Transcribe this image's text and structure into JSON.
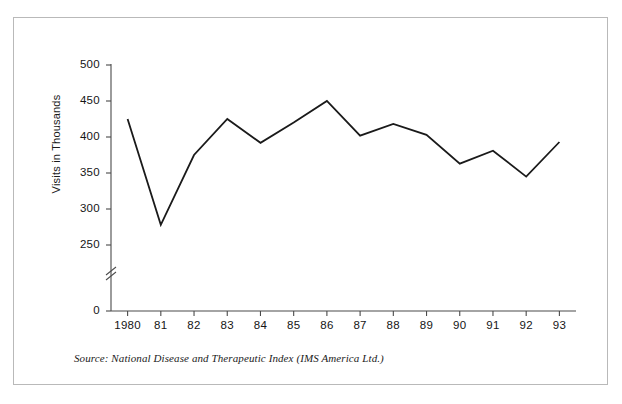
{
  "figure": {
    "frame_color": "#b9b9b9",
    "background": "#ffffff",
    "line_color": "#1a1a1a",
    "axis_color": "#4a4a4a"
  },
  "source_note": "Source: National Disease and Therapeutic Index (IMS America Ltd.)",
  "axis_break_symbol": "axis-break-double-slash",
  "chart_data": {
    "type": "line",
    "title": "",
    "subtitle": "",
    "xlabel": "",
    "ylabel": "Visits in Thousands",
    "categories": [
      "1980",
      "81",
      "82",
      "83",
      "84",
      "85",
      "86",
      "87",
      "88",
      "89",
      "90",
      "91",
      "92",
      "93"
    ],
    "values": [
      425,
      278,
      375,
      425,
      392,
      420,
      450,
      402,
      418,
      403,
      363,
      381,
      345,
      393
    ],
    "series": [
      {
        "name": "Visits in Thousands",
        "values": [
          425,
          278,
          375,
          425,
          392,
          420,
          450,
          402,
          418,
          403,
          363,
          381,
          345,
          393
        ]
      }
    ],
    "y_ticks": [
      0,
      250,
      300,
      350,
      400,
      450,
      500
    ],
    "y_tick_labels": [
      "0",
      "250",
      "300",
      "350",
      "400",
      "450",
      "500"
    ],
    "ylim": [
      250,
      500
    ],
    "y_axis_has_break": true,
    "grid": false,
    "legend": "none",
    "markers": "none",
    "line_width": 1.8
  }
}
